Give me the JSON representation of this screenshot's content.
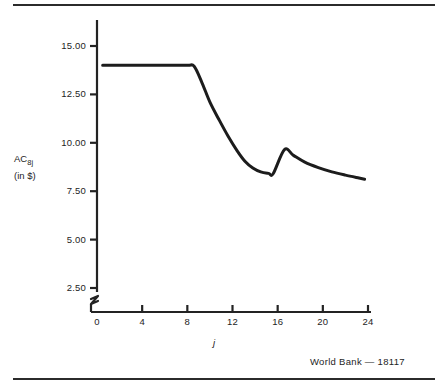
{
  "figure": {
    "credit": "World Bank — 18117",
    "top_rule": true,
    "bottom_rule": true,
    "axis_break": true,
    "line_color": "#1c1c1c",
    "axis_color": "#232323",
    "background": "#ffffff"
  },
  "chart_data": {
    "type": "line",
    "title": "",
    "subtitle": "",
    "xlabel": "j",
    "ylabel_main": "AC",
    "ylabel_sub": "8j",
    "ylabel_units": "(in $)",
    "grid": false,
    "legend": "none",
    "xlim": [
      0,
      24
    ],
    "ylim": [
      2.5,
      15.5
    ],
    "xticks": [
      0,
      4,
      8,
      12,
      16,
      20,
      24
    ],
    "xticklabels": [
      "0",
      "4",
      "8",
      "12",
      "16",
      "20",
      "24"
    ],
    "yticks": [
      2.5,
      5.0,
      7.5,
      10.0,
      12.5,
      15.0
    ],
    "yticklabels": [
      "2.50",
      "5.00",
      "7.50",
      "10.00",
      "12.50",
      "15.00"
    ],
    "series": [
      {
        "name": "AC_8j",
        "x": [
          0.5,
          2.0,
          4.0,
          6.0,
          8.0,
          8.6,
          9.3,
          10.0,
          10.8,
          11.6,
          12.4,
          13.1,
          13.8,
          14.5,
          15.2,
          15.6,
          16.6,
          17.4,
          18.4,
          19.6,
          20.8,
          22.0,
          23.2,
          23.7
        ],
        "y": [
          14.0,
          14.0,
          14.0,
          14.0,
          14.0,
          13.95,
          13.1,
          12.1,
          11.2,
          10.35,
          9.6,
          9.05,
          8.7,
          8.5,
          8.42,
          8.4,
          9.65,
          9.35,
          9.0,
          8.72,
          8.5,
          8.33,
          8.18,
          8.12
        ]
      }
    ]
  },
  "axis_tick_pixels": {
    "x0_px": 97,
    "x24_px": 368,
    "y15_px": 46,
    "y2_5_px": 288
  }
}
